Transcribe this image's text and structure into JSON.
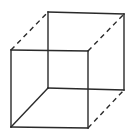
{
  "diagram": {
    "type": "wireframe-cube",
    "stroke_color": "#2a2a2a",
    "background": "#ffffff",
    "vertices": {
      "back_top_left": [
        48,
        12
      ],
      "back_top_right": [
        124,
        14
      ],
      "back_bottom_right": [
        124,
        90
      ],
      "back_bottom_left": [
        48,
        88
      ],
      "front_top_left": [
        11,
        50
      ],
      "front_top_right": [
        88,
        51
      ],
      "front_bottom_right": [
        88,
        128
      ],
      "front_bottom_left": [
        11,
        127
      ]
    },
    "edges": [
      {
        "name": "back-top-edge",
        "from": "back_top_left",
        "to": "back_top_right",
        "style": "solid"
      },
      {
        "name": "back-right-edge",
        "from": "back_top_right",
        "to": "back_bottom_right",
        "style": "solid"
      },
      {
        "name": "back-bottom-edge",
        "from": "back_bottom_right",
        "to": "back_bottom_left",
        "style": "solid"
      },
      {
        "name": "back-left-edge",
        "from": "back_bottom_left",
        "to": "back_top_left",
        "style": "solid"
      },
      {
        "name": "front-top-edge",
        "from": "front_top_left",
        "to": "front_top_right",
        "style": "solid"
      },
      {
        "name": "front-right-edge",
        "from": "front_top_right",
        "to": "front_bottom_right",
        "style": "solid"
      },
      {
        "name": "front-bottom-edge",
        "from": "front_bottom_right",
        "to": "front_bottom_left",
        "style": "solid"
      },
      {
        "name": "front-left-edge",
        "from": "front_bottom_left",
        "to": "front_top_left",
        "style": "solid"
      },
      {
        "name": "top-left-connector",
        "from": "front_top_left",
        "to": "back_top_left",
        "style": "dashed"
      },
      {
        "name": "top-right-connector",
        "from": "front_top_right",
        "to": "back_top_right",
        "style": "dashed"
      },
      {
        "name": "bottom-right-connector",
        "from": "front_bottom_right",
        "to": "back_bottom_right",
        "style": "dashed"
      },
      {
        "name": "bottom-left-connector",
        "from": "front_bottom_left",
        "to": "back_bottom_left",
        "style": "solid"
      }
    ]
  }
}
